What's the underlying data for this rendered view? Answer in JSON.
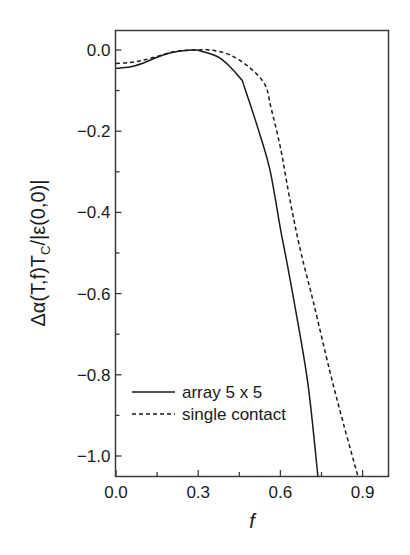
{
  "chart_data": {
    "type": "line",
    "title": "",
    "xlabel": "f",
    "ylabel": "Δα(T,f)T_C/|ε(0,0)|",
    "xlim": [
      0.0,
      1.0
    ],
    "ylim": [
      -1.05,
      0.05
    ],
    "x_ticks": [
      0.0,
      0.3,
      0.6,
      0.9
    ],
    "x_tick_labels": [
      "0.0",
      "0.3",
      "0.6",
      "0.9"
    ],
    "x_minor_ticks": [
      0.15,
      0.45,
      0.75
    ],
    "y_ticks": [
      0.0,
      -0.2,
      -0.4,
      -0.6,
      -0.8,
      -1.0
    ],
    "y_tick_labels": [
      "0.0",
      "−0.2",
      "−0.4",
      "−0.6",
      "−0.8",
      "−1.0"
    ],
    "y_minor_ticks": [
      -0.1,
      -0.3,
      -0.5,
      -0.7,
      -0.9
    ],
    "grid": false,
    "legend_position": "lower left",
    "series": [
      {
        "name": "array 5 x 5",
        "style": "solid",
        "color": "#1a1a1a",
        "x": [
          0.0,
          0.05,
          0.1,
          0.15,
          0.2,
          0.25,
          0.29,
          0.307,
          0.38,
          0.453,
          0.47,
          0.526,
          0.562,
          0.6,
          0.62,
          0.65,
          0.7,
          0.737
        ],
        "y": [
          -0.045,
          -0.042,
          -0.032,
          -0.018,
          -0.007,
          -0.001,
          0.0,
          -0.002,
          -0.02,
          -0.069,
          -0.094,
          -0.21,
          -0.296,
          -0.44,
          -0.51,
          -0.62,
          -0.82,
          -1.05
        ]
      },
      {
        "name": "single contact",
        "style": "dashed",
        "color": "#1a1a1a",
        "x": [
          0.0,
          0.05,
          0.1,
          0.15,
          0.2,
          0.25,
          0.3,
          0.343,
          0.416,
          0.489,
          0.544,
          0.566,
          0.6,
          0.635,
          0.672,
          0.72,
          0.78,
          0.83,
          0.883
        ],
        "y": [
          -0.033,
          -0.031,
          -0.025,
          -0.016,
          -0.006,
          -0.001,
          0.0,
          0.0,
          -0.012,
          -0.044,
          -0.086,
          -0.143,
          -0.24,
          -0.37,
          -0.49,
          -0.62,
          -0.79,
          -0.92,
          -1.05
        ]
      }
    ]
  },
  "labels": {
    "xlabel": "f",
    "ylabel_main": "Δα(T,f)T",
    "ylabel_sub": "C",
    "ylabel_tail": "/|ε(0,0)|",
    "legend": [
      "array 5 x 5",
      "single contact"
    ]
  }
}
